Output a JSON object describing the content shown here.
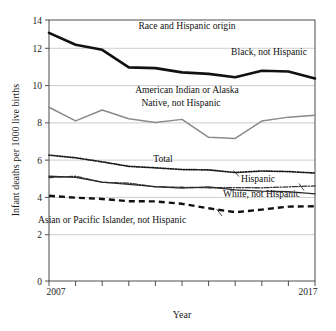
{
  "chart_data": {
    "type": "line",
    "title": "",
    "xlabel": "Year",
    "ylabel": "Infant deaths per 1000 live births",
    "x": [
      2007,
      2008,
      2009,
      2010,
      2011,
      2012,
      2013,
      2014,
      2015,
      2016,
      2017
    ],
    "xlim": [
      2007,
      2017
    ],
    "ylim": [
      0,
      14
    ],
    "yticks": [
      0,
      2,
      4,
      6,
      8,
      10,
      12,
      14
    ],
    "ytick_labels": [
      "0",
      "2",
      "4",
      "6",
      "8",
      "10",
      "12",
      "14"
    ],
    "xtick_labels": [
      "2007",
      "",
      "",
      "",
      "",
      "",
      "",
      "",
      "",
      "",
      "2017"
    ],
    "xtick_first": "2007",
    "xtick_last": "2017",
    "grid": "horizontal",
    "legend_position": "inline-annotations",
    "group_label": "Race and Hispanic origin",
    "series": [
      {
        "name": "Black, not Hispanic",
        "style": "solid-thick",
        "color": "#111111",
        "values": [
          13.31,
          12.67,
          12.4,
          11.46,
          11.42,
          11.19,
          11.11,
          10.93,
          11.28,
          11.24,
          10.86
        ]
      },
      {
        "name": "American Indian or Alaska Native, not Hispanic",
        "style": "solid",
        "color": "#8a8a8a",
        "values": [
          9.32,
          8.59,
          9.17,
          8.7,
          8.5,
          8.67,
          7.71,
          7.65,
          8.58,
          8.79,
          8.89
        ]
      },
      {
        "name": "Total",
        "style": "dotted",
        "color": "#1a1a1a",
        "values": [
          6.75,
          6.61,
          6.39,
          6.15,
          6.07,
          5.98,
          5.96,
          5.82,
          5.9,
          5.87,
          5.79
        ]
      },
      {
        "name": "Hispanic",
        "style": "dash-dot",
        "color": "#333333",
        "values": [
          5.55,
          5.62,
          5.29,
          5.25,
          5.05,
          5.03,
          5.0,
          5.01,
          5.0,
          5.05,
          5.1
        ]
      },
      {
        "name": "White, not Hispanic",
        "style": "solid",
        "color": "#2a2a2a",
        "values": [
          5.62,
          5.56,
          5.3,
          5.18,
          5.06,
          4.98,
          5.05,
          4.89,
          4.82,
          4.79,
          4.67
        ]
      },
      {
        "name": "Asian or Pacific Islander, not Hispanic",
        "style": "dashed-thick",
        "color": "#111111",
        "values": [
          4.57,
          4.47,
          4.4,
          4.28,
          4.27,
          4.14,
          3.9,
          3.69,
          3.83,
          3.99,
          4.01
        ]
      }
    ],
    "annotations": [
      {
        "text": "Race and Hispanic origin",
        "series": "group-label"
      },
      {
        "text": "Black, not Hispanic",
        "series": "Black, not Hispanic"
      },
      {
        "text": "American Indian or Alaska",
        "series": "American Indian or Alaska Native, not Hispanic"
      },
      {
        "text": "Native, not Hispanic",
        "series": "American Indian or Alaska Native, not Hispanic"
      },
      {
        "text": "Total",
        "series": "Total"
      },
      {
        "text": "Hispanic",
        "series": "Hispanic"
      },
      {
        "text": "White, not Hispanic",
        "series": "White, not Hispanic"
      },
      {
        "text": "Asian or Pacific Islander, not Hispanic",
        "series": "Asian or Pacific Islander, not Hispanic"
      }
    ]
  },
  "labels": {
    "y_axis_title": "Infant deaths per 1000 live births",
    "x_axis_title": "Year",
    "x_first": "2007",
    "x_last": "2017",
    "y_14": "14",
    "y_12": "12",
    "y_10": "10",
    "y_8": "8",
    "y_6": "6",
    "y_4": "4",
    "y_2": "2",
    "y_0": "0",
    "ann_group": "Race and Hispanic origin",
    "ann_black": "Black, not Hispanic",
    "ann_aian_1": "American Indian or Alaska",
    "ann_aian_2": "Native, not Hispanic",
    "ann_total": "Total",
    "ann_hispanic": "Hispanic",
    "ann_white": "White, not Hispanic",
    "ann_asian": "Asian or Pacific Islander, not Hispanic"
  }
}
